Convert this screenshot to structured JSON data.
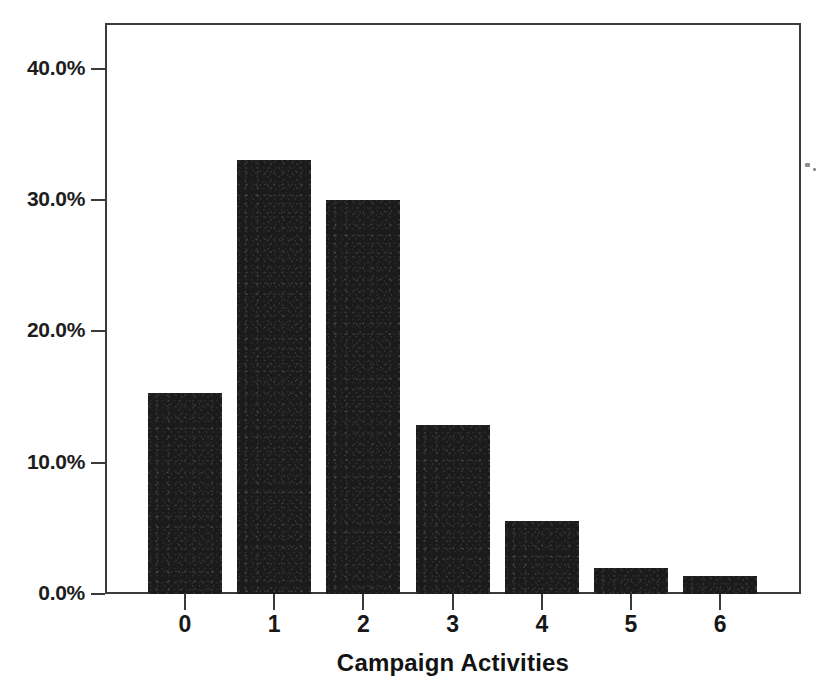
{
  "chart_data": {
    "type": "bar",
    "title": "",
    "subtitle": "",
    "xlabel": "Campaign Activities",
    "ylabel": "",
    "categories": [
      "0",
      "1",
      "2",
      "3",
      "4",
      "5",
      "6"
    ],
    "values": [
      15.3,
      33.1,
      30.0,
      12.9,
      5.6,
      2.0,
      1.4
    ],
    "value_unit": "percent",
    "ylim": [
      0,
      43.5
    ],
    "y_ticks": [
      0.0,
      10.0,
      20.0,
      30.0,
      40.0
    ],
    "y_tick_labels": [
      "0.0%",
      "10.0%",
      "20.0%",
      "30.0%",
      "40.0%"
    ],
    "x_tick_labels": [
      "0",
      "1",
      "2",
      "3",
      "4",
      "5",
      "6"
    ],
    "grid": false,
    "legend": false,
    "legend_position": "none",
    "series": [
      {
        "name": "Share of respondents",
        "values": [
          15.3,
          33.1,
          30.0,
          12.9,
          5.6,
          2.0,
          1.4
        ]
      }
    ],
    "bar_color": "#1b1b1b",
    "axis_color": "#3a3a3a",
    "background_color": "#ffffff"
  },
  "axis": {
    "x_title": "Campaign Activities"
  },
  "y_axis": {
    "ticks": [
      {
        "label": "40.0%",
        "value": 40.0
      },
      {
        "label": "30.0%",
        "value": 30.0
      },
      {
        "label": "20.0%",
        "value": 20.0
      },
      {
        "label": "10.0%",
        "value": 10.0
      },
      {
        "label": "0.0%",
        "value": 0.0
      }
    ]
  }
}
